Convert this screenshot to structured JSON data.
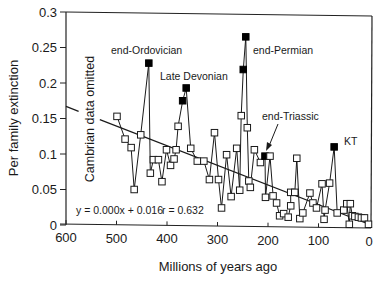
{
  "chart_data": {
    "type": "line",
    "title": "",
    "xlabel": "Millions of years ago",
    "ylabel": "Per family extinction",
    "xlim": [
      600,
      0
    ],
    "ylim": [
      0,
      0.3
    ],
    "x_reversed": true,
    "grid": false,
    "legend": null,
    "x_ticks": [
      600,
      500,
      400,
      300,
      200,
      100,
      0
    ],
    "x_tick_labels": [
      "600",
      "500",
      "400",
      "300",
      "200",
      "100",
      "0"
    ],
    "y_ticks": [
      0,
      0.05,
      0.1,
      0.15,
      0.2,
      0.25,
      0.3
    ],
    "y_tick_labels": [
      "0",
      "0.05",
      "0.1",
      "0.15",
      "0.2",
      "0.25",
      "0.3"
    ],
    "series": [
      {
        "name": "Per family extinction",
        "marker": "open-square",
        "points": [
          {
            "x": 499,
            "y": 0.153
          },
          {
            "x": 483,
            "y": 0.121
          },
          {
            "x": 471,
            "y": 0.109
          },
          {
            "x": 465,
            "y": 0.05
          },
          {
            "x": 452,
            "y": 0.127
          },
          {
            "x": 436,
            "y": 0.228,
            "filled": true
          },
          {
            "x": 433,
            "y": 0.073
          },
          {
            "x": 427,
            "y": 0.092
          },
          {
            "x": 417,
            "y": 0.092
          },
          {
            "x": 410,
            "y": 0.061
          },
          {
            "x": 401,
            "y": 0.106
          },
          {
            "x": 393,
            "y": 0.084
          },
          {
            "x": 386,
            "y": 0.093
          },
          {
            "x": 382,
            "y": 0.106
          },
          {
            "x": 378,
            "y": 0.139
          },
          {
            "x": 369,
            "y": 0.175,
            "filled": true
          },
          {
            "x": 362,
            "y": 0.193,
            "filled": true
          },
          {
            "x": 353,
            "y": 0.108
          },
          {
            "x": 340,
            "y": 0.09
          },
          {
            "x": 327,
            "y": 0.09
          },
          {
            "x": 316,
            "y": 0.064
          },
          {
            "x": 306,
            "y": 0.13
          },
          {
            "x": 298,
            "y": 0.064
          },
          {
            "x": 292,
            "y": 0.024
          },
          {
            "x": 282,
            "y": 0.099
          },
          {
            "x": 273,
            "y": 0.04
          },
          {
            "x": 262,
            "y": 0.108
          },
          {
            "x": 256,
            "y": 0.049
          },
          {
            "x": 253,
            "y": 0.154
          },
          {
            "x": 249,
            "y": 0.219,
            "filled": true
          },
          {
            "x": 244,
            "y": 0.265,
            "filled": true
          },
          {
            "x": 241,
            "y": 0.137
          },
          {
            "x": 238,
            "y": 0.062
          },
          {
            "x": 235,
            "y": 0.053
          },
          {
            "x": 227,
            "y": 0.106
          },
          {
            "x": 215,
            "y": 0.088
          },
          {
            "x": 206,
            "y": 0.097,
            "filled": true
          },
          {
            "x": 205,
            "y": 0.039
          },
          {
            "x": 196,
            "y": 0.097
          },
          {
            "x": 190,
            "y": 0.041
          },
          {
            "x": 183,
            "y": 0.031
          },
          {
            "x": 177,
            "y": 0.013
          },
          {
            "x": 169,
            "y": 0.016
          },
          {
            "x": 160,
            "y": 0.011
          },
          {
            "x": 155,
            "y": 0.027
          },
          {
            "x": 155,
            "y": 0.046
          },
          {
            "x": 147,
            "y": 0.046
          },
          {
            "x": 143,
            "y": 0.094
          },
          {
            "x": 137,
            "y": 0.009
          },
          {
            "x": 131,
            "y": 0.017
          },
          {
            "x": 117,
            "y": 0.045
          },
          {
            "x": 111,
            "y": 0.031
          },
          {
            "x": 104,
            "y": 0.024
          },
          {
            "x": 93,
            "y": 0.058
          },
          {
            "x": 89,
            "y": 0.008
          },
          {
            "x": 87,
            "y": 0.021
          },
          {
            "x": 78,
            "y": 0.059
          },
          {
            "x": 69,
            "y": 0.11,
            "filled": true
          },
          {
            "x": 63,
            "y": 0.017
          },
          {
            "x": 50,
            "y": 0.021
          },
          {
            "x": 44,
            "y": 0.03
          },
          {
            "x": 39,
            "y": 0.001
          },
          {
            "x": 37,
            "y": 0.03
          },
          {
            "x": 33,
            "y": 0.013
          },
          {
            "x": 28,
            "y": 0.012
          },
          {
            "x": 21,
            "y": 0.011
          },
          {
            "x": 15,
            "y": 0.01
          },
          {
            "x": 9,
            "y": 0.01
          },
          {
            "x": 1,
            "y": 0.001
          }
        ]
      }
    ],
    "regression": {
      "equation": "y = 0.000x + 0.016",
      "r": "r = 0.632",
      "from": {
        "x": 600,
        "y": 0.167
      },
      "to": {
        "x": 0,
        "y": 0.001
      }
    },
    "annotations": [
      {
        "text": "end-Ordovician",
        "x": 436,
        "y": 0.228
      },
      {
        "text": "Late Devonian",
        "x": 362,
        "y": 0.193
      },
      {
        "text": "end-Permian",
        "x": 244,
        "y": 0.265
      },
      {
        "text": "end-Triassic",
        "x": 206,
        "y": 0.097,
        "arrow": true
      },
      {
        "text": "KT",
        "x": 69,
        "y": 0.11
      },
      {
        "text": "Cambrian data omitted",
        "rotated": true
      }
    ]
  },
  "labels": {
    "ylabel": "Per family extinction",
    "xlabel": "Millions of years ago",
    "cambrian_note": "Cambrian data omitted",
    "equation": "y = 0.000x + 0.016",
    "r_value": "r = 0.632",
    "end_ordovician": "end-Ordovician",
    "late_devonian": "Late Devonian",
    "end_permian": "end-Permian",
    "end_triassic": "end-Triassic",
    "kt": "KT"
  }
}
